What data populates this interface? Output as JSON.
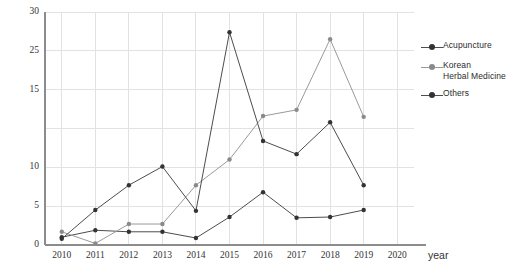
{
  "chart_data": {
    "type": "line",
    "title": "",
    "subtitle": "",
    "xlabel": "year",
    "ylabel": "",
    "x": [
      2010,
      2011,
      2012,
      2013,
      2014,
      2015,
      2016,
      2017,
      2018,
      2019
    ],
    "categories": [
      "2010",
      "2011",
      "2012",
      "2013",
      "2014",
      "2015",
      "2016",
      "2017",
      "2018",
      "2019"
    ],
    "xlim": [
      2009.5,
      2020.5
    ],
    "ylim": [
      0,
      30
    ],
    "y_ticks": [
      0,
      5,
      10,
      15,
      20,
      25,
      30
    ],
    "y_tick_labels": [
      "0",
      "5",
      "10",
      "",
      "15",
      "25",
      "30"
    ],
    "x_tick_labels": [
      "2010",
      "2011",
      "2012",
      "2013",
      "2014",
      "2015",
      "2016",
      "2017",
      "2018",
      "2019",
      "2020"
    ],
    "grid": true,
    "legend_position": "right",
    "series": [
      {
        "name": "Acupuncture",
        "color": "#4d4d4d",
        "values": [
          1.0,
          1.9,
          1.7,
          1.7,
          0.9,
          3.6,
          6.8,
          3.5,
          3.6,
          4.5
        ]
      },
      {
        "name": "Korean\nHerbal Medicine",
        "color": "#9a9a9a",
        "values": [
          1.7,
          0.2,
          2.7,
          2.7,
          7.7,
          11.0,
          16.6,
          17.4,
          26.5,
          16.5
        ]
      },
      {
        "name": "Others",
        "color": "#4d4d4d",
        "values": [
          0.8,
          4.5,
          7.7,
          10.1,
          4.4,
          27.4,
          13.4,
          11.7,
          15.8,
          7.7
        ]
      }
    ]
  },
  "legend": {
    "items": [
      {
        "label": "Acupuncture"
      },
      {
        "label": "Korean\nHerbal Medicine"
      },
      {
        "label": "Others"
      }
    ]
  },
  "axes": {
    "x_title": "year"
  },
  "colors": {
    "series_dark": "#4d4d4d",
    "series_light": "#9a9a9a",
    "grid": "#e2e2e2",
    "axis": "#8c8c8c",
    "text": "#333333"
  }
}
